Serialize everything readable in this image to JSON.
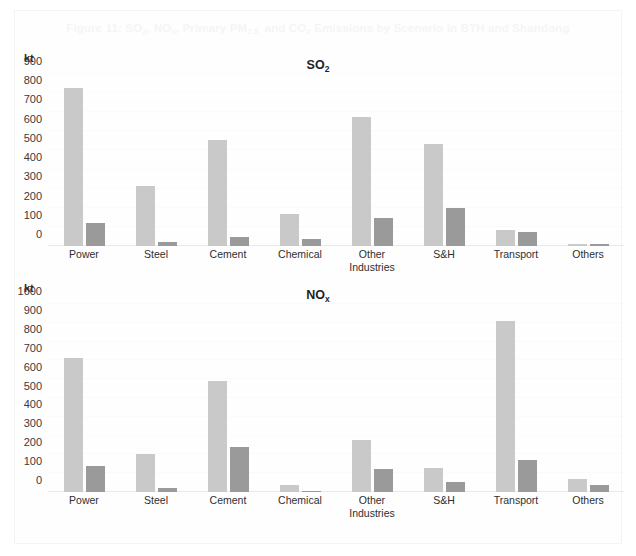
{
  "figure": {
    "title_prefix": "Figure 11: SO",
    "title_full": "Figure 11: SO2, NOx, Primary PM2.5, and CO2 Emissions by Scenario in BTH and Shandong",
    "title_parts": {
      "p1": "Figure 11: SO",
      "s1": "2",
      "p2": ", NO",
      "s2": "x",
      "p3": ", Primary PM",
      "s3": "2.5,",
      "p4": " and CO",
      "s4": "2",
      "p5": " Emissions by Scenario in BTH and Shandong"
    }
  },
  "colors": {
    "series1": "#c9c9c9",
    "series2": "#9a9a9a",
    "gridline": "#fafafb",
    "axis": "#e9e9ea",
    "text": "#2e2e2e",
    "title_faded": "#f5f5f6",
    "background": "#ffffff"
  },
  "charts": [
    {
      "id": "so2",
      "unit": "kt",
      "title_main": "SO",
      "title_sub": "2",
      "chart_data": {
        "type": "bar",
        "title": "SO2",
        "xlabel": "",
        "ylabel": "kt",
        "ylim": [
          0,
          900
        ],
        "yticks": [
          900,
          800,
          700,
          600,
          500,
          400,
          300,
          200,
          100,
          0
        ],
        "grid": true,
        "legend": "none",
        "categories": [
          "Power",
          "Steel",
          "Cement",
          "Chemical",
          "Other Industries",
          "S&H",
          "Transport",
          "Others"
        ],
        "series": [
          {
            "name": "Scenario 1",
            "values": [
              828,
              313,
              557,
              170,
              673,
              535,
              85,
              12
            ]
          },
          {
            "name": "Scenario 2",
            "values": [
              120,
              22,
              48,
              38,
              145,
              200,
              72,
              8
            ]
          }
        ]
      }
    },
    {
      "id": "nox",
      "unit": "kt",
      "title_main": "NO",
      "title_sub": "x",
      "chart_data": {
        "type": "bar",
        "title": "NOx",
        "xlabel": "",
        "ylabel": "kt",
        "ylim": [
          0,
          1000
        ],
        "yticks": [
          1000,
          900,
          800,
          700,
          600,
          500,
          400,
          300,
          200,
          100,
          0
        ],
        "grid": true,
        "legend": "none",
        "categories": [
          "Power",
          "Steel",
          "Cement",
          "Chemical",
          "Other\nIndustries",
          "S&H",
          "Transport",
          "Others"
        ],
        "series": [
          {
            "name": "Scenario 1",
            "values": [
              715,
              200,
              588,
              38,
              275,
              130,
              908,
              70
            ]
          },
          {
            "name": "Scenario 2",
            "values": [
              140,
              22,
              240,
              8,
              125,
              52,
              172,
              35
            ]
          }
        ]
      }
    }
  ]
}
